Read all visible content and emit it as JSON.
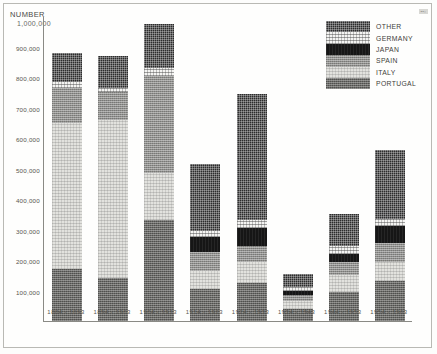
{
  "chart_data": {
    "type": "bar",
    "subtype": "stacked",
    "title": "NUMBER",
    "unit_label": "1,000,000",
    "xlabel": "",
    "ylabel": "NUMBER",
    "ylim": [
      0,
      1000000
    ],
    "grid": false,
    "legend_position": "top-right",
    "categories": [
      "1884 - 1893",
      "1894 - 1903",
      "1904 - 1913",
      "1914 - 1923",
      "1924 - 1933",
      "1934 - 1943",
      "1944 - 1953",
      "1954 - 1963"
    ],
    "ytick_labels": [
      "900,000",
      "800,000",
      "700,000",
      "600,000",
      "500,000",
      "400,000",
      "300,000",
      "200,000",
      "100,000"
    ],
    "ytick_values": [
      900000,
      800000,
      700000,
      600000,
      500000,
      400000,
      300000,
      200000,
      100000
    ],
    "series": [
      {
        "name": "PORTUGAL",
        "pattern": "portugal",
        "values": [
          170000,
          140000,
          330000,
          105000,
          125000,
          40000,
          95000,
          130000
        ]
      },
      {
        "name": "ITALY",
        "pattern": "italy",
        "values": [
          480000,
          520000,
          155000,
          60000,
          70000,
          25000,
          55000,
          65000
        ]
      },
      {
        "name": "SPAIN",
        "pattern": "spain",
        "values": [
          115000,
          90000,
          320000,
          60000,
          50000,
          20000,
          45000,
          60000
        ]
      },
      {
        "name": "JAPAN",
        "pattern": "japan",
        "values": [
          0,
          0,
          0,
          50000,
          60000,
          15000,
          25000,
          55000
        ]
      },
      {
        "name": "GERMANY",
        "pattern": "germany",
        "values": [
          20000,
          15000,
          25000,
          20000,
          25000,
          10000,
          25000,
          25000
        ]
      },
      {
        "name": "OTHER",
        "pattern": "other",
        "values": [
          95000,
          105000,
          145000,
          220000,
          415000,
          45000,
          105000,
          225000
        ]
      }
    ],
    "totals": [
      880000,
      870000,
      975000,
      515000,
      745000,
      155000,
      350000,
      560000
    ]
  },
  "legend": {
    "items": [
      {
        "label": "OTHER",
        "pattern": "other"
      },
      {
        "label": "GERMANY",
        "pattern": "germany"
      },
      {
        "label": "JAPAN",
        "pattern": "japan"
      },
      {
        "label": "SPAIN",
        "pattern": "spain"
      },
      {
        "label": "ITALY",
        "pattern": "italy"
      },
      {
        "label": "PORTUGAL",
        "pattern": "portugal"
      }
    ]
  },
  "corner_mark": "▪▪▫"
}
